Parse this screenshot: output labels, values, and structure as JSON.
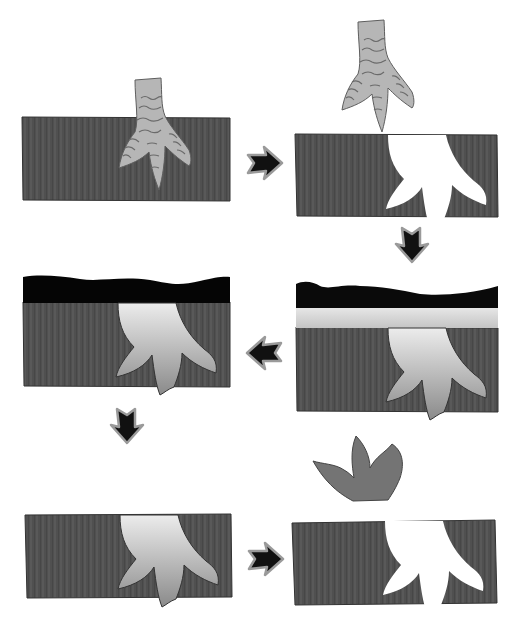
{
  "header": {
    "text": ""
  },
  "diagram": {
    "colors": {
      "rock": "#505050",
      "rock_stripe": "#5a5a5a",
      "outline": "#2a2a2a",
      "foot": "#b4b4b4",
      "foot_scale_lines": "#6a6a6a",
      "sediment_dark": "#0a0a0a",
      "sediment_light": "#d6d6d6",
      "cast_top": "#e4e4e4",
      "cast_bottom": "#8e8e8e",
      "lifted_cast": "#747474",
      "arrow_fill": "#111111",
      "arrow_outline": "#9a9a9a",
      "background": "#ffffff"
    },
    "panels": [
      {
        "id": 1,
        "label": "Foot pressing into soft mud",
        "position": "top-left"
      },
      {
        "id": 2,
        "label": "Foot lifted, footprint impression left in mud",
        "position": "top-right"
      },
      {
        "id": 3,
        "label": "Footprint filled with sediment and buried",
        "position": "middle-right"
      },
      {
        "id": 4,
        "label": "Sediment hardens into a cast, overburden above",
        "position": "middle-left"
      },
      {
        "id": 5,
        "label": "Overburden eroded, cast exposed in rock",
        "position": "bottom-left"
      },
      {
        "id": 6,
        "label": "Cast separated from mold, natural cast and mold",
        "position": "bottom-right"
      }
    ],
    "arrows": [
      {
        "from": 1,
        "to": 2,
        "direction": "right"
      },
      {
        "from": 2,
        "to": 3,
        "direction": "down"
      },
      {
        "from": 3,
        "to": 4,
        "direction": "left"
      },
      {
        "from": 4,
        "to": 5,
        "direction": "down"
      },
      {
        "from": 5,
        "to": 6,
        "direction": "right"
      }
    ]
  }
}
